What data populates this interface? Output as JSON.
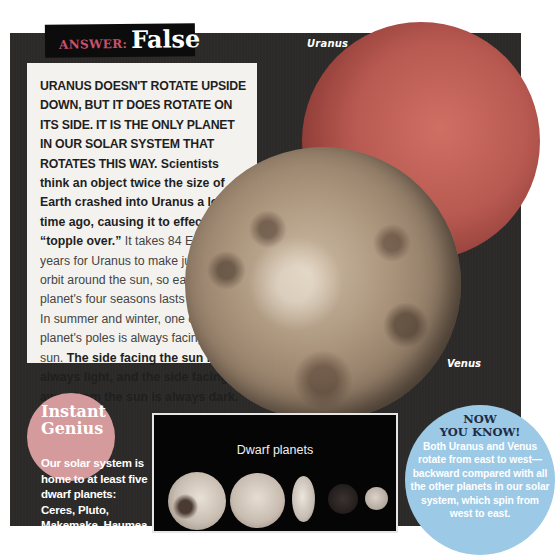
{
  "answer": {
    "label": "ANSWER:",
    "value": "False"
  },
  "planet_labels": {
    "uranus": "Uranus",
    "venus": "Venus"
  },
  "main_text": {
    "lead": "Uranus doesn't rotate upside down, but it does rotate on its side. It is the only planet in our solar system that rotates this way.",
    "sentence_2": "Scientists think an object twice the size of Earth crashed into Uranus a long time ago, causing it to effectively “topple over.”",
    "sentence_3": "It takes 84 Earth years for Uranus to make just one orbit around the sun, so each of the planet's four seasons lasts 21 years. In summer and winter, one of the planet's poles is always facing the sun.",
    "sentence_4": "The side facing the sun is always light, and the side facing away from the sun is always dark."
  },
  "instant_genius": {
    "title_line1": "Instant",
    "title_line2": "Genius",
    "body": "Our solar system is home to at least five dwarf planets: Ceres, Pluto, Makemake, Haumea, and Eris."
  },
  "dwarf_planets_figure": {
    "title": "Dwarf planets",
    "bodies": [
      "dwarf-planet-1",
      "dwarf-planet-2",
      "dwarf-planet-3",
      "dwarf-planet-4",
      "dwarf-planet-5"
    ]
  },
  "now_you_know": {
    "title_line1": "NOW",
    "title_line2": "YOU KNOW!",
    "body": "Both Uranus and Venus rotate from east to west—backward compared with all the other planets in our solar system, which spin from west to east."
  },
  "colors": {
    "panel_bg": "#2b2a29",
    "answer_label": "#c7516a",
    "uranus": "#b95a52",
    "genius_circle": "#d49a9c",
    "now_circle": "#9cc9e6",
    "now_title": "#1e2c47"
  }
}
